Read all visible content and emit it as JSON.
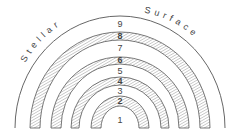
{
  "diagram": {
    "title_left": "Stellar",
    "title_right": "Surface",
    "layers": [
      {
        "label": "1",
        "hatched": false
      },
      {
        "label": "2",
        "hatched": true
      },
      {
        "label": "3",
        "hatched": false
      },
      {
        "label": "4",
        "hatched": true
      },
      {
        "label": "5",
        "hatched": false
      },
      {
        "label": "6",
        "hatched": true
      },
      {
        "label": "7",
        "hatched": false
      },
      {
        "label": "8",
        "hatched": true
      },
      {
        "label": "9",
        "hatched": false
      }
    ],
    "colors": {
      "line": "#555555",
      "hatch": "#777777",
      "background": "#ffffff"
    }
  }
}
